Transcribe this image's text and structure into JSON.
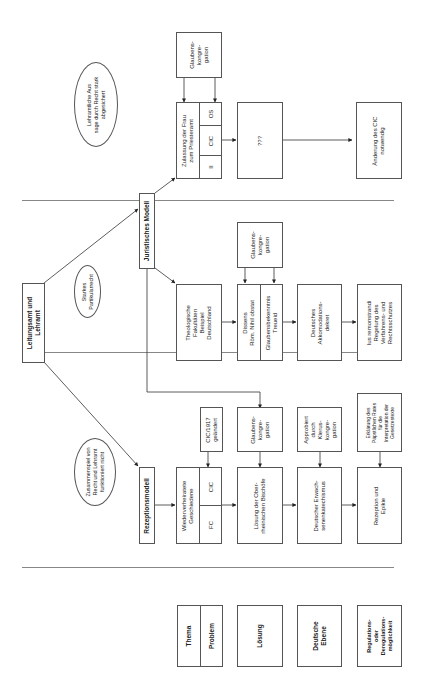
{
  "diagram": {
    "orientation": "rotated 90° counterclockwise",
    "root": {
      "label": "Leitungsamt und\nLehramt"
    },
    "annotations": [
      {
        "id": "lehramtliche",
        "label": "Lehramtliche Aus\nsage durch Recht stark\nabgesichert"
      },
      {
        "id": "starkes",
        "label": "Starkes\nPartikularrecht"
      },
      {
        "id": "zusammenspiel",
        "label": "Zusammenspiel von\nRecht und Lehramt\nfunktioniert nicht"
      }
    ],
    "models": [
      {
        "id": "juristisches",
        "label": "Juristisches Modell"
      },
      {
        "id": "rezeptions",
        "label": "Rezeptionsmodell"
      }
    ],
    "legend": {
      "thema": "Thema",
      "problem": "Problem",
      "loesung": "Lösung",
      "deutsche_ebene": "Deutsche\nEbene",
      "regulation": "Regulations-\noder\nDeregulations-\nmöglichkeit"
    },
    "column_top": {
      "glaubens": "Glaubens-\nkongre-\ngation",
      "thema": "Zulassung der Frau\nzum Priesteramt",
      "sub": [
        "II",
        "CIC",
        "OS"
      ],
      "loesung": "???",
      "regulation": "Änderung des CIC\nnotwendig"
    },
    "column_middle": {
      "thema": "Theologische\nFakultäten\nBeispiel\nDeutschland",
      "glaubens": "Glaubens-\nkongre-\ngation",
      "loesung_a": "Dissens\nRöm. Nihil obstat",
      "loesung_b": "Glaubensbekenntnis\nTreueid",
      "deutsche": "Deutsches\nAkkomodations-\ndekret",
      "regulation": "Ius remonstrandi\nRegelung des\nVerfahrens- und\nRechtsschutzes"
    },
    "column_bottom": {
      "cic1917": "CIC/1917\ngeändert",
      "thema": "Wiederverheiratete\nGeschiedene",
      "sub": [
        "FC",
        "CIC"
      ],
      "glaubens": "Glaubens-\nkongre-\ngation",
      "loesung": "Lösung der Ober-\nrheinischen Bischöfe",
      "approbiert": "Approbiert\ndurch\nKlerus-\nkongre-\ngation",
      "deutsche": "Deutscher Erwach-\nsenenkatechismus",
      "erklaerung": "Erklärung des\nPäpstlichen Rates\nfür die\nInterpretation der\nGesetzestexte",
      "regulation": "Rezeption und\nEpikie"
    },
    "colors": {
      "line": "#555555",
      "separator": "#888888",
      "background": "#ffffff"
    }
  }
}
